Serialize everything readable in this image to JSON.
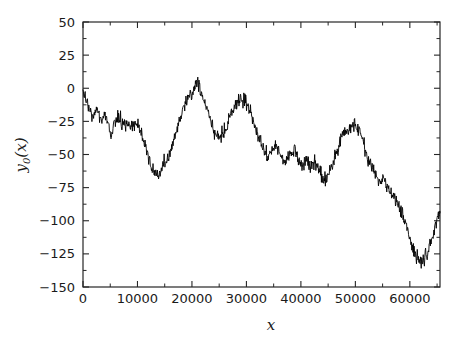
{
  "chart_data": {
    "type": "line",
    "title": "",
    "subtitle": "",
    "xlabel": "x",
    "ylabel": "y_0(x)",
    "ylabel_base": "y",
    "ylabel_sub": "0",
    "ylabel_arg": "(x)",
    "xlim": [
      0,
      65536
    ],
    "ylim": [
      -150,
      50
    ],
    "xticks": [
      0,
      10000,
      20000,
      30000,
      40000,
      50000,
      60000
    ],
    "xticklabels": [
      "0",
      "10000",
      "20000",
      "30000",
      "40000",
      "50000",
      "60000"
    ],
    "yticks": [
      -150,
      -125,
      -100,
      -75,
      -50,
      -25,
      0,
      25,
      50
    ],
    "yticklabels": [
      "-150",
      "-125",
      "-100",
      "-75",
      "-50",
      "-25",
      "0",
      "25",
      "50"
    ],
    "x_minor_tick_interval": 5000,
    "y_minor_tick_interval": 12.5,
    "grid": false,
    "legend": null,
    "legend_position": "none",
    "line_color": "#000000",
    "frame_color": "#262626",
    "background_color": "#ffffff",
    "series": [
      {
        "name": "y_0",
        "description": "noisy random-walk trace",
        "noise_amplitude": 9.0,
        "noise_seed": 20250411,
        "samples_per_segment": 11,
        "trend_x": [
          0,
          900,
          1800,
          2600,
          3400,
          4200,
          5000,
          5800,
          6600,
          7400,
          8200,
          9000,
          9800,
          10600,
          11400,
          12200,
          13000,
          13800,
          14600,
          15400,
          16200,
          17000,
          17800,
          18600,
          19400,
          20200,
          21000,
          21800,
          22600,
          23400,
          24200,
          25000,
          25800,
          26600,
          27400,
          28200,
          29000,
          29800,
          30600,
          31400,
          32200,
          33000,
          33800,
          34600,
          35400,
          36200,
          37000,
          37800,
          38600,
          39400,
          40200,
          41000,
          41800,
          42600,
          43400,
          44200,
          45000,
          45800,
          46600,
          47400,
          48200,
          49000,
          49800,
          50600,
          51400,
          52200,
          53000,
          53800,
          54600,
          55400,
          56200,
          57000,
          57800,
          58600,
          59400,
          60200,
          61000,
          61800,
          62600,
          63400,
          64200,
          65000,
          65536
        ],
        "trend_y": [
          -2,
          -14,
          -22,
          -17,
          -26,
          -20,
          -36,
          -27,
          -22,
          -29,
          -24,
          -30,
          -26,
          -33,
          -42,
          -55,
          -62,
          -66,
          -58,
          -54,
          -46,
          -34,
          -22,
          -12,
          -6,
          -2,
          6,
          -4,
          -14,
          -24,
          -32,
          -40,
          -34,
          -26,
          -18,
          -12,
          -8,
          -10,
          -16,
          -26,
          -36,
          -44,
          -52,
          -48,
          -42,
          -50,
          -56,
          -52,
          -46,
          -52,
          -58,
          -54,
          -60,
          -56,
          -62,
          -70,
          -66,
          -58,
          -46,
          -38,
          -34,
          -30,
          -26,
          -30,
          -40,
          -52,
          -60,
          -66,
          -72,
          -70,
          -76,
          -82,
          -88,
          -94,
          -104,
          -116,
          -126,
          -132,
          -128,
          -122,
          -112,
          -98,
          -94
        ]
      }
    ]
  },
  "axes": {
    "frame": {
      "left_px": 83,
      "right_px": 440,
      "top_px": 22,
      "bottom_px": 287
    }
  }
}
